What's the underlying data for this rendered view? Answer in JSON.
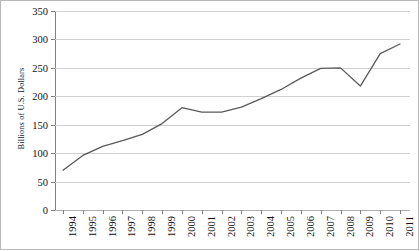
{
  "chart_data": {
    "type": "line",
    "title": "",
    "xlabel": "",
    "ylabel": "Billions of U.S. Dollars",
    "ylim": [
      0,
      350
    ],
    "ytick_step": 50,
    "yticks": [
      0,
      50,
      100,
      150,
      200,
      250,
      300,
      350
    ],
    "ytick_labels": [
      "0",
      "50",
      "100",
      "150",
      "200",
      "250",
      "300",
      "350"
    ],
    "grid": true,
    "legend": false,
    "legend_position": "none",
    "categories": [
      "1994",
      "1995",
      "1996",
      "1997",
      "1998",
      "1999",
      "2000",
      "2001",
      "2002",
      "2003",
      "2004",
      "2005",
      "2006",
      "2007",
      "2008",
      "2009",
      "2010",
      "2011"
    ],
    "values": [
      70,
      96,
      112,
      122,
      133,
      152,
      180,
      172,
      172,
      181,
      196,
      212,
      232,
      249,
      250,
      218,
      275,
      292
    ],
    "series": [
      {
        "name": "Billions of U.S. Dollars",
        "color": "#595959",
        "values": [
          70,
          96,
          112,
          122,
          133,
          152,
          180,
          172,
          172,
          181,
          196,
          212,
          232,
          249,
          250,
          218,
          275,
          292
        ]
      }
    ],
    "line_color": "#595959",
    "grid_color": "#d0d0d0",
    "axis_color": "#808080",
    "background_color": "#ffffff"
  }
}
